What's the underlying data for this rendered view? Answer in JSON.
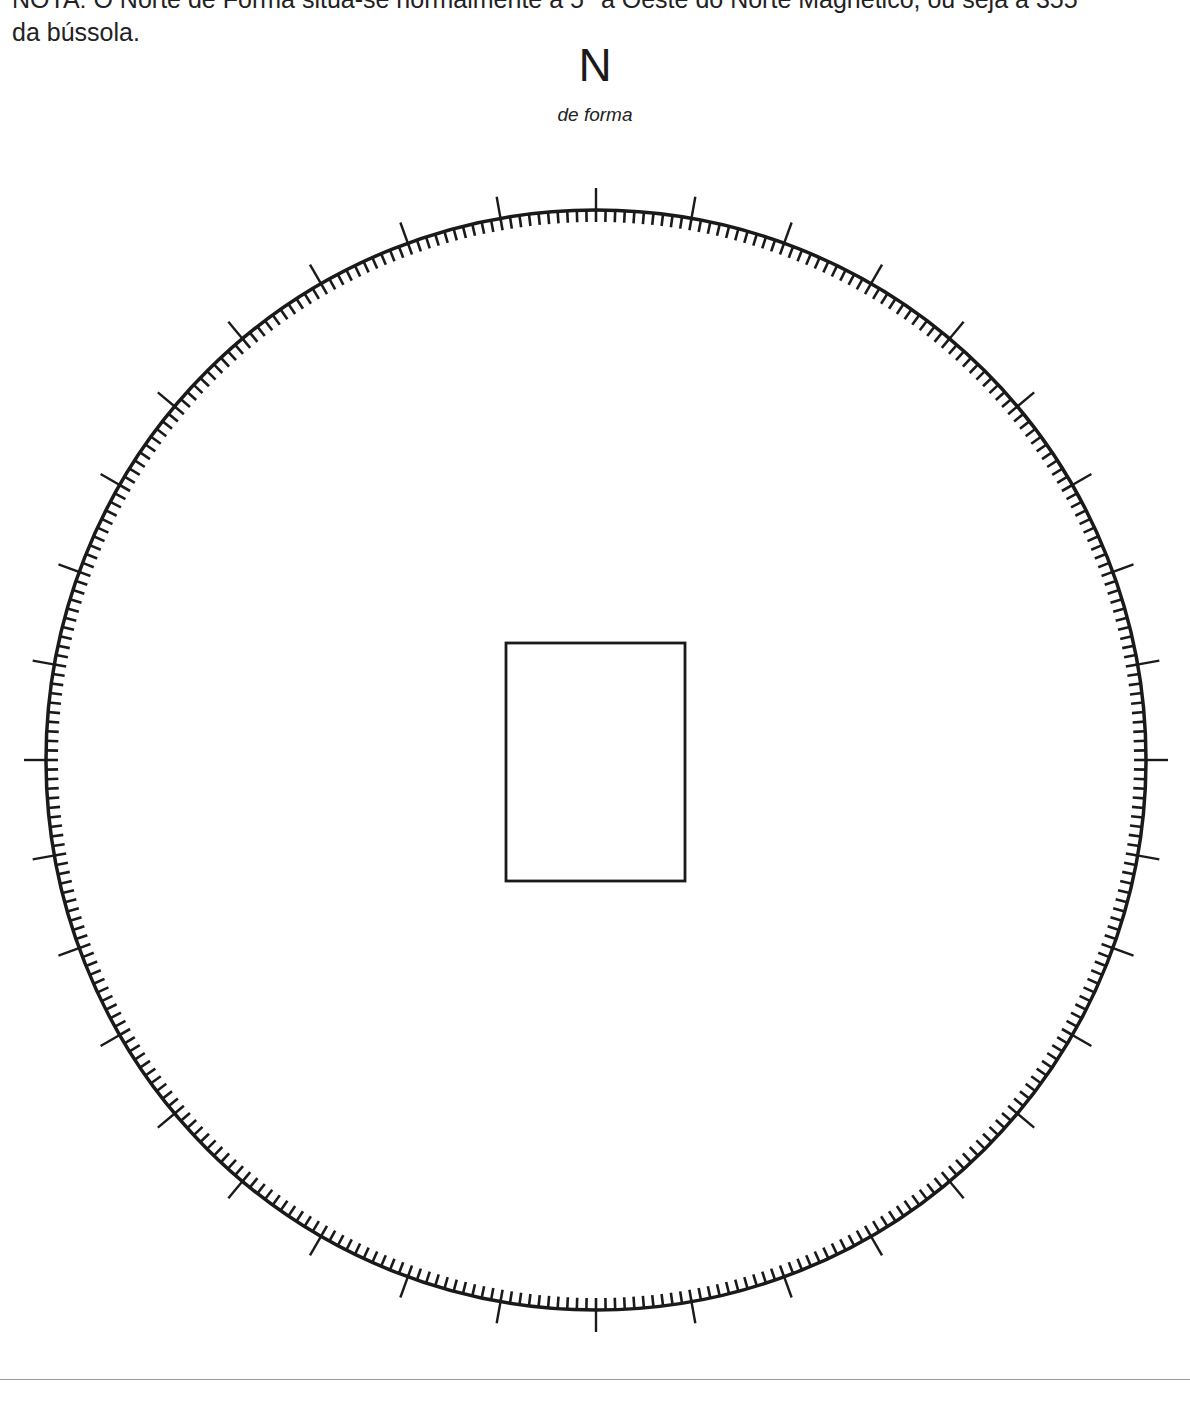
{
  "note": {
    "line1": "NOTA: O Norte de Forma situa-se normalmente a 5° a Oeste do Norte Magnético, ou seja a 355",
    "line2": "da bússola."
  },
  "north": {
    "letter": "N",
    "subtitle": "de forma"
  },
  "dial": {
    "center_x": 596,
    "center_y": 760,
    "radius": 550,
    "minor_tick_every_deg": 1,
    "minor_tick_count": 360,
    "minor_tick_length_inward": 12,
    "major_tick_every_deg": 10,
    "major_tick_count": 36,
    "major_tick_length_outward": 22,
    "stroke_color": "#1a1a1a"
  },
  "center_box": {
    "x": 506,
    "y": 643,
    "width": 179,
    "height": 238
  },
  "colors": {
    "ink": "#1a1a1a",
    "rule": "#9a9a9a",
    "background": "#ffffff"
  }
}
